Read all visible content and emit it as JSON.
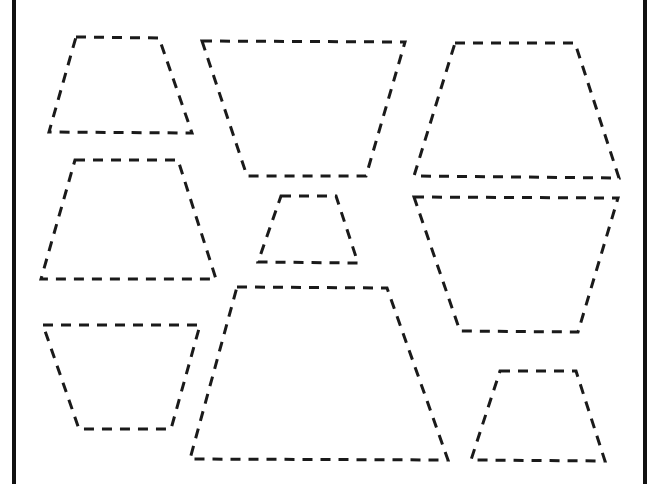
{
  "worksheet": {
    "title": "",
    "background": "#ffffff",
    "stroke_color": "#1a1a1a",
    "border": {
      "left_x": 14,
      "right_x": 645,
      "color": "#111111"
    },
    "shapes": [
      {
        "id": "trapezoid-1",
        "kind": "trapezoid",
        "orientation": "narrow-top",
        "points": [
          [
            76,
            37
          ],
          [
            159,
            38
          ],
          [
            192,
            133
          ],
          [
            49,
            132
          ]
        ]
      },
      {
        "id": "trapezoid-2",
        "kind": "trapezoid",
        "orientation": "wide-top",
        "points": [
          [
            202,
            41
          ],
          [
            405,
            42
          ],
          [
            366,
            176
          ],
          [
            247,
            176
          ]
        ]
      },
      {
        "id": "trapezoid-3",
        "kind": "trapezoid",
        "orientation": "narrow-top",
        "points": [
          [
            455,
            43
          ],
          [
            575,
            43
          ],
          [
            619,
            178
          ],
          [
            414,
            176
          ]
        ]
      },
      {
        "id": "trapezoid-4",
        "kind": "trapezoid",
        "orientation": "narrow-top",
        "points": [
          [
            75,
            160
          ],
          [
            178,
            160
          ],
          [
            216,
            279
          ],
          [
            41,
            279
          ]
        ]
      },
      {
        "id": "trapezoid-5",
        "kind": "trapezoid",
        "orientation": "narrow-top",
        "points": [
          [
            281,
            196
          ],
          [
            336,
            196
          ],
          [
            358,
            263
          ],
          [
            258,
            262
          ]
        ]
      },
      {
        "id": "trapezoid-6",
        "kind": "trapezoid",
        "orientation": "wide-top",
        "points": [
          [
            414,
            197
          ],
          [
            618,
            198
          ],
          [
            578,
            332
          ],
          [
            460,
            331
          ]
        ]
      },
      {
        "id": "trapezoid-7",
        "kind": "trapezoid",
        "orientation": "wide-top",
        "points": [
          [
            43,
            325
          ],
          [
            200,
            325
          ],
          [
            171,
            429
          ],
          [
            79,
            429
          ]
        ]
      },
      {
        "id": "trapezoid-8",
        "kind": "trapezoid",
        "orientation": "narrow-top",
        "points": [
          [
            237,
            287
          ],
          [
            387,
            288
          ],
          [
            448,
            460
          ],
          [
            190,
            459
          ]
        ]
      },
      {
        "id": "trapezoid-9",
        "kind": "trapezoid",
        "orientation": "narrow-top",
        "points": [
          [
            500,
            371
          ],
          [
            576,
            371
          ],
          [
            605,
            461
          ],
          [
            471,
            460
          ]
        ]
      }
    ]
  }
}
